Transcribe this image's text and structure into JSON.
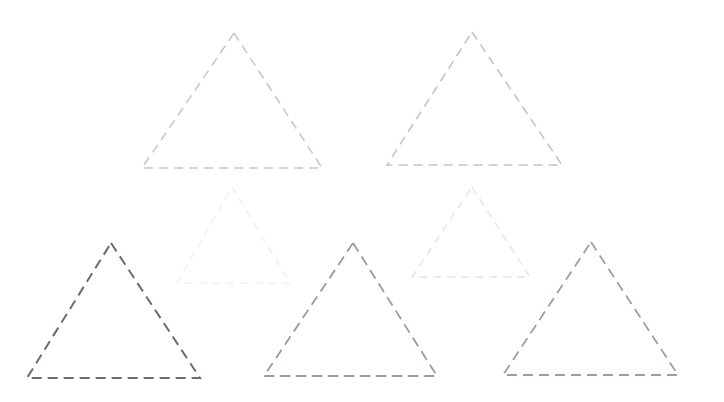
{
  "figure": {
    "background_color": "#ffffff",
    "width": 724,
    "height": 402,
    "shape_count": 7,
    "shape_type": "triangle",
    "stroke_style": "dashed"
  },
  "chart_data": {
    "type": "scatter",
    "subtitle": "",
    "xlabel": "",
    "ylabel": "",
    "xlim": [
      0,
      724
    ],
    "ylim": [
      0,
      402
    ],
    "grid": false,
    "legend": "none",
    "axes_visible": false,
    "tick_labels_x": [],
    "tick_labels_y": [],
    "annotations": [],
    "shapes": [
      {
        "id": "triangle-1",
        "label": "top-left triangle",
        "apex_x": 234,
        "apex_y": 33,
        "base_left_x": 142,
        "base_left_y": 168,
        "base_right_x": 322,
        "base_right_y": 168,
        "width": 180,
        "height": 135,
        "color": "#c9c6cd",
        "stroke_width": 1.6,
        "dash": "9 6"
      },
      {
        "id": "triangle-2",
        "label": "top-right triangle",
        "apex_x": 472,
        "apex_y": 32,
        "base_left_x": 387,
        "base_left_y": 165,
        "base_right_x": 562,
        "base_right_y": 165,
        "width": 175,
        "height": 133,
        "color": "#c5c2c9",
        "stroke_width": 1.6,
        "dash": "9 6"
      },
      {
        "id": "triangle-3",
        "label": "middle-left faint triangle",
        "apex_x": 232,
        "apex_y": 187,
        "base_left_x": 177,
        "base_left_y": 283,
        "base_right_x": 290,
        "base_right_y": 283,
        "width": 113,
        "height": 96,
        "color": "#f3f0f4",
        "stroke_width": 1.6,
        "dash": "8 6"
      },
      {
        "id": "triangle-4",
        "label": "middle-right faint triangle",
        "apex_x": 472,
        "apex_y": 187,
        "base_left_x": 412,
        "base_left_y": 277,
        "base_right_x": 530,
        "base_right_y": 277,
        "width": 118,
        "height": 90,
        "color": "#e8e4ea",
        "stroke_width": 1.6,
        "dash": "8 6"
      },
      {
        "id": "triangle-5",
        "label": "bottom-left dark triangle",
        "apex_x": 111,
        "apex_y": 243,
        "base_left_x": 27,
        "base_left_y": 378,
        "base_right_x": 200,
        "base_right_y": 378,
        "width": 173,
        "height": 135,
        "color": "#6e6878",
        "stroke_width": 2.0,
        "dash": "10 6"
      },
      {
        "id": "triangle-6",
        "label": "bottom-middle triangle",
        "apex_x": 353,
        "apex_y": 243,
        "base_left_x": 264,
        "base_left_y": 376,
        "base_right_x": 437,
        "base_right_y": 376,
        "width": 173,
        "height": 133,
        "color": "#9c97a4",
        "stroke_width": 1.8,
        "dash": "10 6"
      },
      {
        "id": "triangle-7",
        "label": "bottom-right triangle",
        "apex_x": 591,
        "apex_y": 242,
        "base_left_x": 503,
        "base_left_y": 375,
        "base_right_x": 678,
        "base_right_y": 375,
        "width": 175,
        "height": 133,
        "color": "#a09ba8",
        "stroke_width": 1.8,
        "dash": "10 6"
      }
    ]
  }
}
